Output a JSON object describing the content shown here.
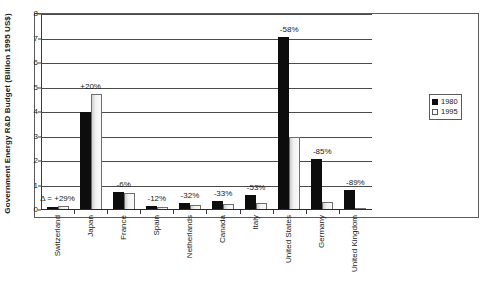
{
  "chart_data": {
    "type": "bar",
    "title": "",
    "subtitle": "",
    "xlabel": "",
    "ylabel": "Government Energy R&D Budget (Billion 1995 US$)",
    "ylim": [
      0,
      8
    ],
    "ytick_labels": [
      "0",
      "1",
      "2",
      "3",
      "4",
      "5",
      "6",
      "7",
      "8"
    ],
    "ytick_values": [
      0,
      1,
      2,
      3,
      4,
      5,
      6,
      7,
      8
    ],
    "grid": "horizontal",
    "legend_position": "right",
    "categories": [
      "Switzerland",
      "Japan",
      "France",
      "Spain",
      "Netherlands",
      "Canada",
      "Italy",
      "United States",
      "Germany",
      "United Kingdom"
    ],
    "series": [
      {
        "name": "1980",
        "color": "#0d0d0d",
        "values": [
          0.12,
          4.0,
          0.74,
          0.16,
          0.28,
          0.35,
          0.62,
          7.05,
          2.1,
          0.8
        ]
      },
      {
        "name": "1995",
        "color": "#fafafa",
        "values": [
          0.17,
          4.75,
          0.68,
          0.13,
          0.19,
          0.24,
          0.28,
          2.96,
          0.34,
          0.08
        ]
      }
    ],
    "annotations": [
      {
        "category": "Switzerland",
        "text": "Δ = +29%",
        "value_pct": 29
      },
      {
        "category": "Japan",
        "text": "+20%",
        "value_pct": 20
      },
      {
        "category": "France",
        "text": "-6%",
        "value_pct": -6
      },
      {
        "category": "Spain",
        "text": "-12%",
        "value_pct": -12
      },
      {
        "category": "Netherlands",
        "text": "-32%",
        "value_pct": -32
      },
      {
        "category": "Canada",
        "text": "-33%",
        "value_pct": -33
      },
      {
        "category": "Italy",
        "text": "-53%",
        "value_pct": -53
      },
      {
        "category": "United States",
        "text": "-58%",
        "value_pct": -58
      },
      {
        "category": "Germany",
        "text": "-85%",
        "value_pct": -85
      },
      {
        "category": "United Kingdom",
        "text": "-89%",
        "value_pct": -89
      }
    ]
  },
  "legend": {
    "entries": [
      {
        "label": "1980"
      },
      {
        "label": "1995"
      }
    ]
  }
}
